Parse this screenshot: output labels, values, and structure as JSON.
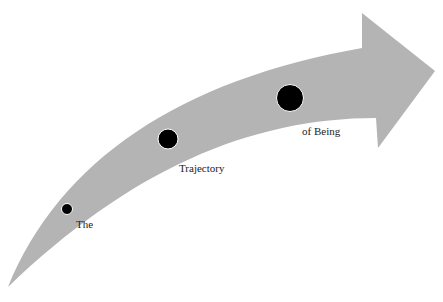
{
  "diagram": {
    "type": "curved-arrow-trajectory",
    "arrow_color": "#b4b4b4",
    "dot_color": "#000000",
    "dot_outline": "#ffffff",
    "points": [
      {
        "label": "The",
        "size": "small"
      },
      {
        "label": "Trajectory",
        "size": "medium"
      },
      {
        "label": "of Being",
        "size": "large"
      }
    ]
  }
}
